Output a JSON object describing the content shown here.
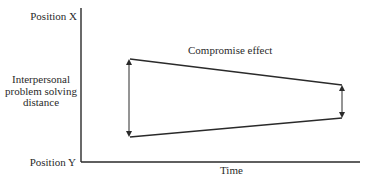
{
  "diagram": {
    "y_axis": {
      "top_label": "Position X",
      "bottom_label": "Position Y",
      "label_lines": [
        "Interpersonal",
        "problem solving",
        "distance"
      ]
    },
    "x_axis": {
      "label": "Time"
    },
    "annotation": "Compromise effect",
    "colors": {
      "line": "#2a2a2a",
      "background": "#ffffff"
    },
    "geometry": {
      "axis_origin": [
        81,
        162
      ],
      "y_axis_top": [
        81,
        8
      ],
      "x_axis_end": [
        360,
        162
      ],
      "upper_line": [
        [
          130,
          59
        ],
        [
          342,
          85
        ]
      ],
      "lower_line": [
        [
          130,
          137
        ],
        [
          342,
          118
        ]
      ],
      "left_arrow": {
        "x": 129,
        "y1": 59,
        "y2": 137
      },
      "right_arrow": {
        "x": 342,
        "y1": 85,
        "y2": 118
      }
    }
  }
}
